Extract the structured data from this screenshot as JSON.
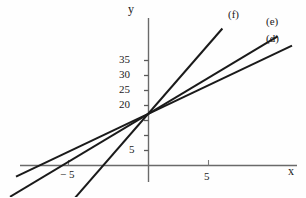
{
  "figure": {
    "background_color": "#fefefe",
    "ink_color": "#1a1a1a",
    "axis_color": "#555555"
  },
  "axes": {
    "x_axis_label": "x",
    "y_axis_label": "y",
    "x_ticks": [
      {
        "value": -5,
        "label": "− 5",
        "px": 68
      },
      {
        "value": 5,
        "label": "5",
        "px": 208
      }
    ],
    "y_ticks": [
      {
        "value": 5,
        "label": "5",
        "px": 150
      },
      {
        "value": 10,
        "label": "",
        "px": 135
      },
      {
        "value": 15,
        "label": "",
        "px": 120
      },
      {
        "value": 20,
        "label": "20",
        "px": 105
      },
      {
        "value": 25,
        "label": "25",
        "px": 90
      },
      {
        "value": 30,
        "label": "30",
        "px": 75
      },
      {
        "value": 35,
        "label": "35",
        "px": 60
      }
    ],
    "origin_px": {
      "x": 148,
      "y": 165
    },
    "x_unit_px": 12,
    "y_unit_px": 3
  },
  "chart_data": {
    "type": "line",
    "title": "",
    "xlabel": "x",
    "ylabel": "y",
    "xlim": [
      -11,
      13
    ],
    "ylim": [
      -9,
      47
    ],
    "grid": false,
    "legend": "inline-end-labels",
    "x_ticks": [
      -5,
      5
    ],
    "y_ticks": [
      5,
      20,
      25,
      30,
      35
    ],
    "series": [
      {
        "name": "(d)",
        "label": "(d)",
        "intercept": 17,
        "slope": 1.9,
        "x": [
          -11,
          12
        ],
        "y": [
          -3.9,
          39.8
        ]
      },
      {
        "name": "(e)",
        "label": "(e)",
        "intercept": 17,
        "slope": 2.4,
        "x": [
          -11.5,
          10.8
        ],
        "y": [
          -10.6,
          42.9
        ]
      },
      {
        "name": "(f)",
        "label": "(f)",
        "intercept": 17,
        "slope": 4.6,
        "x": [
          -6.2,
          6.2
        ],
        "y": [
          -11.5,
          45.5
        ]
      }
    ]
  },
  "annotations": {
    "line_labels": [
      {
        "text": "(f)",
        "left": 228,
        "top": 10
      },
      {
        "text": "(e)",
        "left": 266,
        "top": 17
      },
      {
        "text": "(d)",
        "left": 266,
        "top": 34
      }
    ],
    "tick_labels": [
      {
        "text": "35",
        "left": 119,
        "top": 54
      },
      {
        "text": "30",
        "left": 119,
        "top": 69
      },
      {
        "text": "25",
        "left": 119,
        "top": 84
      },
      {
        "text": "20",
        "left": 119,
        "top": 99
      },
      {
        "text": "5",
        "left": 128,
        "top": 143
      },
      {
        "text": "− 5",
        "left": 61,
        "top": 168
      },
      {
        "text": "5",
        "left": 204,
        "top": 170
      }
    ],
    "axis_names": [
      {
        "text": "y",
        "left": 128,
        "top": 4
      },
      {
        "text": "x",
        "left": 288,
        "top": 167
      }
    ]
  }
}
